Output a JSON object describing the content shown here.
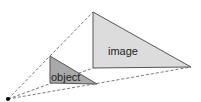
{
  "diagram": {
    "type": "projection",
    "origin": {
      "x": 8,
      "y": 99
    },
    "object": {
      "label": "object",
      "points": [
        [
          50,
          56
        ],
        [
          50,
          83
        ],
        [
          97,
          84
        ]
      ],
      "fill": "#a9a9a9",
      "stroke": "#555555"
    },
    "image": {
      "label": "image",
      "points": [
        [
          93,
          12
        ],
        [
          93,
          68
        ],
        [
          191,
          67
        ]
      ],
      "fill": "#dcdcdc",
      "stroke": "#555555"
    },
    "rays": {
      "color": "#555555",
      "dash": "3,2"
    }
  }
}
